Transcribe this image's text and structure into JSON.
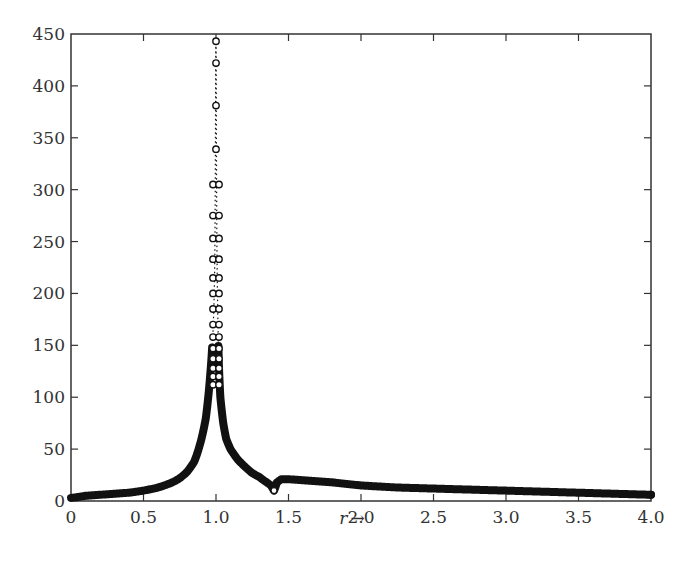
{
  "chart_data": {
    "type": "scatter",
    "title": "",
    "xlabel": "r",
    "xlabel_arrow": "→",
    "ylabel": "",
    "xlim": [
      0,
      4.0
    ],
    "ylim": [
      0,
      450
    ],
    "grid": false,
    "legend": null,
    "x_ticks": [
      "0",
      "0.5",
      "1.0",
      "1.5",
      "2.0",
      "2.5",
      "3.0",
      "3.5",
      "4.0"
    ],
    "x_tick_values": [
      0,
      0.5,
      1.0,
      1.5,
      2.0,
      2.5,
      3.0,
      3.5,
      4.0
    ],
    "y_ticks": [
      "0",
      "50",
      "100",
      "150",
      "200",
      "250",
      "300",
      "350",
      "400",
      "450"
    ],
    "y_tick_values": [
      0,
      50,
      100,
      150,
      200,
      250,
      300,
      350,
      400,
      450
    ],
    "series": [
      {
        "name": "response",
        "marker": "open-circle",
        "line": "dotted",
        "color": "#111111",
        "x": [
          0,
          0.1,
          0.2,
          0.3,
          0.4,
          0.5,
          0.6,
          0.7,
          0.75,
          0.8,
          0.85,
          0.9,
          0.93,
          0.95,
          0.97,
          0.98,
          0.985,
          0.99,
          0.993,
          0.995,
          0.997,
          0.998,
          0.999,
          1.0,
          1.001,
          1.002,
          1.003,
          1.005,
          1.007,
          1.01,
          1.015,
          1.02,
          1.03,
          1.05,
          1.07,
          1.1,
          1.15,
          1.2,
          1.25,
          1.3,
          1.35,
          1.38,
          1.4,
          1.42,
          1.45,
          1.5,
          1.6,
          1.8,
          2.0,
          2.25,
          2.5,
          2.75,
          3.0,
          3.25,
          3.5,
          3.75,
          4.0
        ],
        "y": [
          3,
          5,
          6,
          7,
          8,
          10,
          13,
          18,
          22,
          28,
          38,
          60,
          80,
          105,
          140,
          165,
          185,
          215,
          253,
          305,
          381,
          422,
          443,
          443,
          422,
          381,
          339,
          275,
          233,
          200,
          160,
          130,
          100,
          75,
          60,
          50,
          40,
          33,
          27,
          23,
          18,
          15,
          10,
          18,
          21,
          21,
          20,
          18,
          15,
          13,
          12,
          11,
          10,
          9,
          8,
          7,
          6
        ]
      }
    ],
    "annotations": [
      {
        "x": 1.0,
        "y": 443,
        "text": "resonance peak"
      },
      {
        "x": 1.4,
        "y": 10,
        "text": "local dip"
      }
    ]
  },
  "colors": {
    "axis": "#333333",
    "data": "#111111",
    "background": "#ffffff"
  }
}
